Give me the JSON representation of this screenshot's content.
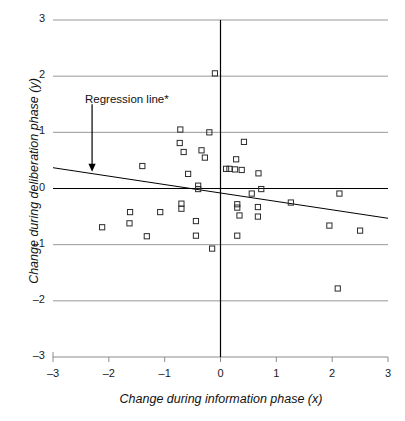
{
  "chart_data": {
    "type": "scatter",
    "title": "",
    "xlabel": "Change during information phase (x)",
    "ylabel": "Change during deliberation phase (y)",
    "xlim": [
      -3,
      3
    ],
    "ylim": [
      -3,
      3
    ],
    "xticks": [
      -3,
      -2,
      -1,
      0,
      1,
      2,
      3
    ],
    "yticks": [
      -3,
      -2,
      -1,
      0,
      1,
      2,
      3
    ],
    "xtick_labels": [
      "-3",
      "-2",
      "-1",
      "0",
      "1",
      "2",
      "3"
    ],
    "ytick_labels": [
      "-3",
      "-2",
      "-1",
      "0",
      "1",
      "2",
      "3"
    ],
    "grid": "horizontal",
    "legend": "none",
    "marker": "open-square",
    "annotations": [
      {
        "text": "Regression line*",
        "x": -1.85,
        "y": 1.72,
        "arrow_to_x": -2.3,
        "arrow_to_y": 0.3
      }
    ],
    "series": [
      {
        "name": "Observations",
        "points": [
          [
            -0.1,
            2.05
          ],
          [
            -0.72,
            1.05
          ],
          [
            -0.2,
            1.0
          ],
          [
            -0.73,
            0.81
          ],
          [
            0.42,
            0.83
          ],
          [
            -0.66,
            0.65
          ],
          [
            -0.34,
            0.68
          ],
          [
            -0.28,
            0.55
          ],
          [
            0.28,
            0.52
          ],
          [
            -1.4,
            0.4
          ],
          [
            0.1,
            0.35
          ],
          [
            0.16,
            0.35
          ],
          [
            0.26,
            0.34
          ],
          [
            0.38,
            0.33
          ],
          [
            0.68,
            0.27
          ],
          [
            -0.58,
            0.26
          ],
          [
            -0.4,
            0.05
          ],
          [
            -0.4,
            -0.01
          ],
          [
            0.73,
            -0.01
          ],
          [
            0.56,
            -0.09
          ],
          [
            2.13,
            -0.09
          ],
          [
            -0.7,
            -0.27
          ],
          [
            1.26,
            -0.25
          ],
          [
            0.3,
            -0.28
          ],
          [
            0.3,
            -0.34
          ],
          [
            -0.7,
            -0.36
          ],
          [
            0.67,
            -0.33
          ],
          [
            -1.62,
            -0.42
          ],
          [
            -1.08,
            -0.42
          ],
          [
            0.34,
            -0.48
          ],
          [
            0.67,
            -0.5
          ],
          [
            -0.44,
            -0.58
          ],
          [
            -1.63,
            -0.62
          ],
          [
            -2.12,
            -0.69
          ],
          [
            1.95,
            -0.66
          ],
          [
            2.5,
            -0.75
          ],
          [
            -1.32,
            -0.85
          ],
          [
            -0.44,
            -0.84
          ],
          [
            0.3,
            -0.84
          ],
          [
            -0.15,
            -1.07
          ],
          [
            2.1,
            -1.78
          ]
        ]
      }
    ],
    "regression_line": {
      "label": "Regression line*",
      "x_start": -3,
      "y_start": 0.37,
      "x_end": 3,
      "y_end": -0.53,
      "slope": -0.15,
      "intercept": -0.08
    },
    "colors": {
      "grid": "#8c8c8c",
      "axis": "#000000",
      "marker_edge": "#2b2b2b",
      "regression": "#000000",
      "background": "#ffffff"
    }
  }
}
